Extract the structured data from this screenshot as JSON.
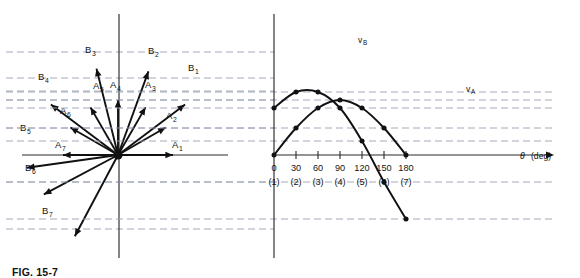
{
  "figure": {
    "caption": "FIG. 15-7",
    "caption_visible_note": "clipped at bottom edge"
  },
  "left_panel": {
    "name": "vector-phasor-diagram",
    "origin": {
      "x": 118,
      "y": 155
    },
    "vertical_axis": {
      "x": 119,
      "y_top": 14,
      "y_bottom": 258
    },
    "horizontal_axis": {
      "y": 155,
      "x_left": 22,
      "x_right": 228
    },
    "vectors": [
      {
        "label": "A",
        "sub": "1",
        "angle_deg": 0,
        "length": 55,
        "label_x": 172,
        "label_y": 148
      },
      {
        "label": "A",
        "sub": "2",
        "angle_deg": 30,
        "length": 55,
        "label_x": 166,
        "label_y": 119
      },
      {
        "label": "A",
        "sub": "3",
        "angle_deg": 60,
        "length": 55,
        "label_x": 145,
        "label_y": 88
      },
      {
        "label": "A",
        "sub": "4",
        "angle_deg": 90,
        "length": 55,
        "label_x": 110,
        "label_y": 88
      },
      {
        "label": "A",
        "sub": "5",
        "angle_deg": 120,
        "length": 55,
        "label_x": 93,
        "label_y": 89
      },
      {
        "label": "A",
        "sub": "6",
        "angle_deg": 150,
        "length": 55,
        "label_x": 60,
        "label_y": 114
      },
      {
        "label": "A",
        "sub": "7",
        "angle_deg": 180,
        "length": 55,
        "label_x": 55,
        "label_y": 148
      },
      {
        "label": "B",
        "sub": "1",
        "angle_deg": 37,
        "length": 84,
        "label_x": 188,
        "label_y": 71
      },
      {
        "label": "B",
        "sub": "2",
        "angle_deg": 70,
        "length": 89,
        "label_x": 148,
        "label_y": 54
      },
      {
        "label": "B",
        "sub": "3",
        "angle_deg": 104,
        "length": 89,
        "label_x": 85,
        "label_y": 53
      },
      {
        "label": "B",
        "sub": "4",
        "angle_deg": 143,
        "length": 84,
        "label_x": 38,
        "label_y": 80
      },
      {
        "label": "B",
        "sub": "5",
        "angle_deg": 188,
        "length": 92,
        "label_x": 20,
        "label_y": 131
      },
      {
        "label": "B",
        "sub": "6",
        "angle_deg": 208,
        "length": 84,
        "label_x": 25,
        "label_y": 171
      },
      {
        "label": "B",
        "sub": "7",
        "angle_deg": 242,
        "length": 92,
        "label_x": 42,
        "label_y": 214
      }
    ],
    "projection_dash_y": [
      52,
      78,
      91,
      100,
      128,
      182,
      229
    ]
  },
  "chart_data": {
    "type": "line",
    "title": "",
    "xlabel": "θ (deg)",
    "ylabel": "",
    "x": [
      0,
      30,
      60,
      90,
      120,
      150,
      180
    ],
    "point_numbers": [
      "(1)",
      "(2)",
      "(3)",
      "(4)",
      "(5)",
      "(6)",
      "(7)"
    ],
    "xtick_labels": [
      "0",
      "30",
      "60",
      "90",
      "120",
      "150",
      "180"
    ],
    "xlim": [
      0,
      180
    ],
    "grid": "horizontal-dashed-projection-lines",
    "legend": "inline-curve-labels",
    "series": [
      {
        "name": "v_A",
        "label": "v",
        "label_sub": "A",
        "values": [
          0,
          27,
          47,
          55,
          47,
          27,
          0
        ],
        "label_x": 466,
        "label_y": 92
      },
      {
        "name": "v_B",
        "label": "v",
        "label_sub": "B",
        "values": [
          47,
          63,
          63,
          47,
          14,
          -27,
          -64
        ],
        "label_x": 358,
        "label_y": 43
      }
    ]
  },
  "right_panel": {
    "name": "waveform-plot",
    "vertical_axis": {
      "x": 274,
      "y_top": 14,
      "y_bottom": 258
    },
    "horizontal_axis": {
      "y": 155,
      "x_left": 274,
      "x_right": 552
    },
    "axis_arrow": "right",
    "x_pixel_per_deg": 0.7333,
    "y_pixel_per_unit": 1.0,
    "axis_title": "θ",
    "axis_title_unit": "(deg)"
  }
}
